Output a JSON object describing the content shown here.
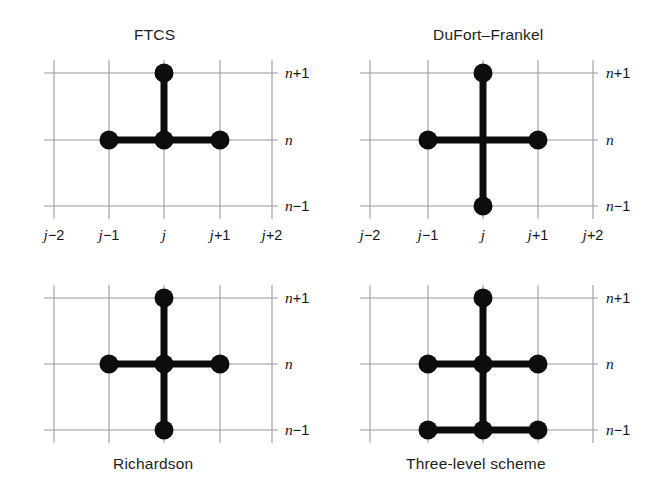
{
  "figure": {
    "width": 647,
    "height": 488,
    "background": "#ffffff",
    "grid_color": "#9a9a9a",
    "node_color": "#0d0d0d",
    "stencil_color": "#0d0d0d"
  },
  "panels": [
    {
      "id": "ftcs",
      "title": "FTCS",
      "title_position": "top",
      "caption": "",
      "x_tick_labels": [
        "j−2",
        "j−1",
        "j",
        "j+1",
        "j+2"
      ],
      "y_tick_labels": [
        "n+1",
        "n",
        "n−1"
      ],
      "nodes": [
        {
          "j": 0,
          "n": 1
        },
        {
          "j": -1,
          "n": 0
        },
        {
          "j": 0,
          "n": 0
        },
        {
          "j": 1,
          "n": 0
        }
      ],
      "edges": [
        {
          "from": {
            "j": 0,
            "n": 0
          },
          "to": {
            "j": 0,
            "n": 1
          }
        },
        {
          "from": {
            "j": -1,
            "n": 0
          },
          "to": {
            "j": 1,
            "n": 0
          }
        }
      ]
    },
    {
      "id": "dufort-frankel",
      "title": "DuFort–Frankel",
      "title_position": "top",
      "caption": "",
      "x_tick_labels": [
        "j−2",
        "j−1",
        "j",
        "j+1",
        "j+2"
      ],
      "y_tick_labels": [
        "n+1",
        "n",
        "n−1"
      ],
      "nodes": [
        {
          "j": 0,
          "n": 1
        },
        {
          "j": -1,
          "n": 0
        },
        {
          "j": 1,
          "n": 0
        },
        {
          "j": 0,
          "n": -1
        }
      ],
      "edges": [
        {
          "from": {
            "j": 0,
            "n": -1
          },
          "to": {
            "j": 0,
            "n": 1
          }
        },
        {
          "from": {
            "j": -1,
            "n": 0
          },
          "to": {
            "j": 1,
            "n": 0
          }
        }
      ]
    },
    {
      "id": "richardson",
      "title": "",
      "title_position": "bottom",
      "caption": "Richardson",
      "x_tick_labels": [
        "j−2",
        "j−1",
        "j",
        "j+1",
        "j+2"
      ],
      "y_tick_labels": [
        "n+1",
        "n",
        "n−1"
      ],
      "nodes": [
        {
          "j": 0,
          "n": 1
        },
        {
          "j": -1,
          "n": 0
        },
        {
          "j": 0,
          "n": 0
        },
        {
          "j": 1,
          "n": 0
        },
        {
          "j": 0,
          "n": -1
        }
      ],
      "edges": [
        {
          "from": {
            "j": 0,
            "n": -1
          },
          "to": {
            "j": 0,
            "n": 1
          }
        },
        {
          "from": {
            "j": -1,
            "n": 0
          },
          "to": {
            "j": 1,
            "n": 0
          }
        }
      ]
    },
    {
      "id": "three-level-scheme",
      "title": "",
      "title_position": "bottom",
      "caption": "Three-level scheme",
      "x_tick_labels": [
        "j−2",
        "j−1",
        "j",
        "j+1",
        "j+2"
      ],
      "y_tick_labels": [
        "n+1",
        "n",
        "n−1"
      ],
      "nodes": [
        {
          "j": 0,
          "n": 1
        },
        {
          "j": -1,
          "n": 0
        },
        {
          "j": 0,
          "n": 0
        },
        {
          "j": 1,
          "n": 0
        },
        {
          "j": -1,
          "n": -1
        },
        {
          "j": 0,
          "n": -1
        },
        {
          "j": 1,
          "n": -1
        }
      ],
      "edges": [
        {
          "from": {
            "j": 0,
            "n": -1
          },
          "to": {
            "j": 0,
            "n": 1
          }
        },
        {
          "from": {
            "j": -1,
            "n": 0
          },
          "to": {
            "j": 1,
            "n": 0
          }
        },
        {
          "from": {
            "j": -1,
            "n": -1
          },
          "to": {
            "j": 1,
            "n": -1
          }
        }
      ]
    }
  ],
  "labels": {
    "ftcs_title": "FTCS",
    "dufort_title": "DuFort–Frankel",
    "richardson_caption": "Richardson",
    "threelevel_caption": "Three-level scheme",
    "x_jm2": "j−2",
    "x_jm1": "j−1",
    "x_j": "j",
    "x_jp1": "j+1",
    "x_jp2": "j+2",
    "y_np1": "n+1",
    "y_n": "n",
    "y_nm1": "n−1"
  }
}
